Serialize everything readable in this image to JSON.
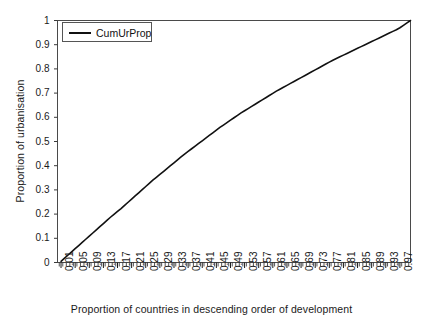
{
  "chart_data": {
    "type": "line",
    "title": "",
    "xlabel": "Proportion of countries in descending order of development",
    "ylabel": "Proportion of urbanisation",
    "legend": [
      "CumUrProp"
    ],
    "legend_position": "top-left",
    "grid": false,
    "xlim": [
      0.0,
      1.0
    ],
    "ylim": [
      0.0,
      1.0
    ],
    "yticks": [
      "0",
      "0.1",
      "0.2",
      "0.3",
      "0.4",
      "0.5",
      "0.6",
      "0.7",
      "0.8",
      "0.9",
      "1"
    ],
    "ytick_values": [
      0,
      0.1,
      0.2,
      0.3,
      0.4,
      0.5,
      0.6,
      0.7,
      0.8,
      0.9,
      1
    ],
    "xticks": [
      "0.01",
      "0.05",
      "0.09",
      "0.13",
      "0.17",
      "0.21",
      "0.25",
      "0.29",
      "0.33",
      "0.37",
      "0.41",
      "0.45",
      "0.49",
      "0.53",
      "0.57",
      "0.61",
      "0.65",
      "0.69",
      "0.73",
      "0.77",
      "0.81",
      "0.85",
      "0.89",
      "0.93",
      "0.97"
    ],
    "xtick_values": [
      0.01,
      0.05,
      0.09,
      0.13,
      0.17,
      0.21,
      0.25,
      0.29,
      0.33,
      0.37,
      0.41,
      0.45,
      0.49,
      0.53,
      0.57,
      0.61,
      0.65,
      0.69,
      0.73,
      0.77,
      0.81,
      0.85,
      0.89,
      0.93,
      0.97
    ],
    "minor_tick_count": 100,
    "series": [
      {
        "name": "CumUrProp",
        "color": "#111111",
        "x": [
          0.01,
          0.02,
          0.03,
          0.04,
          0.05,
          0.06,
          0.07,
          0.08,
          0.09,
          0.1,
          0.11,
          0.12,
          0.13,
          0.14,
          0.15,
          0.16,
          0.17,
          0.18,
          0.19,
          0.2,
          0.21,
          0.22,
          0.23,
          0.24,
          0.25,
          0.26,
          0.27,
          0.28,
          0.29,
          0.3,
          0.31,
          0.32,
          0.33,
          0.34,
          0.35,
          0.36,
          0.37,
          0.38,
          0.39,
          0.4,
          0.41,
          0.42,
          0.43,
          0.44,
          0.45,
          0.46,
          0.47,
          0.48,
          0.49,
          0.5,
          0.51,
          0.52,
          0.53,
          0.54,
          0.55,
          0.56,
          0.57,
          0.58,
          0.59,
          0.6,
          0.61,
          0.62,
          0.63,
          0.64,
          0.65,
          0.66,
          0.67,
          0.68,
          0.69,
          0.7,
          0.71,
          0.72,
          0.73,
          0.74,
          0.75,
          0.76,
          0.77,
          0.78,
          0.79,
          0.8,
          0.81,
          0.82,
          0.83,
          0.84,
          0.85,
          0.86,
          0.87,
          0.88,
          0.89,
          0.9,
          0.91,
          0.92,
          0.93,
          0.94,
          0.95,
          0.96,
          0.97,
          0.98,
          0.99,
          1.0
        ],
        "y": [
          0.005,
          0.018,
          0.031,
          0.044,
          0.057,
          0.07,
          0.083,
          0.096,
          0.109,
          0.122,
          0.135,
          0.148,
          0.161,
          0.174,
          0.187,
          0.199,
          0.211,
          0.223,
          0.236,
          0.249,
          0.262,
          0.275,
          0.288,
          0.301,
          0.314,
          0.327,
          0.34,
          0.352,
          0.364,
          0.376,
          0.388,
          0.4,
          0.412,
          0.424,
          0.436,
          0.448,
          0.459,
          0.47,
          0.481,
          0.492,
          0.503,
          0.514,
          0.525,
          0.536,
          0.547,
          0.558,
          0.568,
          0.578,
          0.588,
          0.598,
          0.608,
          0.618,
          0.627,
          0.636,
          0.645,
          0.654,
          0.663,
          0.672,
          0.681,
          0.69,
          0.699,
          0.708,
          0.716,
          0.724,
          0.732,
          0.74,
          0.748,
          0.756,
          0.764,
          0.772,
          0.78,
          0.788,
          0.796,
          0.804,
          0.812,
          0.82,
          0.828,
          0.836,
          0.843,
          0.85,
          0.857,
          0.864,
          0.871,
          0.878,
          0.885,
          0.892,
          0.899,
          0.906,
          0.913,
          0.92,
          0.927,
          0.934,
          0.941,
          0.948,
          0.955,
          0.962,
          0.97,
          0.98,
          0.99,
          1.0
        ]
      }
    ]
  },
  "legend": {
    "entry_label": "CumUrProp"
  },
  "axes": {
    "x_title": "Proportion of countries in descending order of development",
    "y_title": "Proportion of urbanisation"
  }
}
